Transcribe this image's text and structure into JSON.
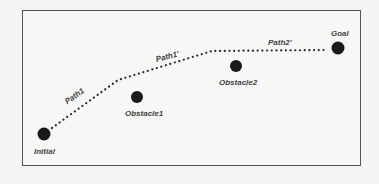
{
  "diagram": {
    "nodes": [
      {
        "id": "initial",
        "label": "Initial",
        "x": 44,
        "y": 134
      },
      {
        "id": "obstacle1",
        "label": "Obstacle1",
        "x": 137,
        "y": 97
      },
      {
        "id": "obstacle2",
        "label": "Obstacle2",
        "x": 236,
        "y": 66
      },
      {
        "id": "goal",
        "label": "Goal",
        "x": 338,
        "y": 48
      }
    ],
    "paths": [
      {
        "id": "path1",
        "label": "Path1"
      },
      {
        "id": "path1prime",
        "label": "Path1'"
      },
      {
        "id": "path2prime",
        "label": "Path2'"
      }
    ],
    "colors": {
      "node": "#1a1a1a",
      "path": "#2a2a2a",
      "frame": "#555555",
      "label": "#444444"
    }
  }
}
